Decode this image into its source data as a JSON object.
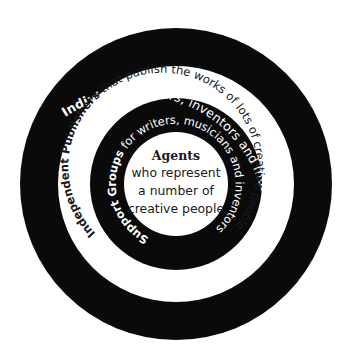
{
  "diagram": {
    "type": "concentric-rings",
    "colors": {
      "ring_dark": "#0a0a0a",
      "ring_light": "#ffffff",
      "text_on_dark": "#ffffff",
      "text_on_light": "#1a1a1a"
    },
    "rings": [
      {
        "level": 1,
        "position": "outer",
        "fill": "black",
        "bold": "Individual",
        "text": " writers, inventors and musicians"
      },
      {
        "level": 2,
        "position": "second",
        "fill": "white",
        "bold": "Independent Publishers",
        "text": " that publish the works of lots of creative people"
      },
      {
        "level": 3,
        "position": "third",
        "fill": "black",
        "bold": "Support Groups",
        "text": " for writers, musicians and inventors"
      }
    ],
    "center": {
      "title": "Agents",
      "lines": [
        "who represent",
        "a number of",
        "creative people"
      ]
    }
  }
}
